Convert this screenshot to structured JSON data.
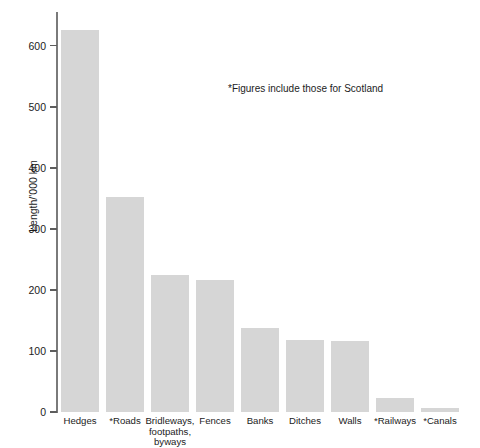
{
  "chart_data": {
    "type": "bar",
    "title": "Length of linear landscape features in Great Britain",
    "categories": [
      "Hedges",
      "*Roads",
      "Bridleways,\nfootpaths,\nbyways",
      "Fences",
      "Banks",
      "Ditches",
      "Walls",
      "*Railways",
      "*Canals"
    ],
    "values": [
      625,
      352,
      224,
      216,
      137,
      118,
      116,
      23,
      7
    ],
    "xlabel": "",
    "ylabel": "Length/'000 km",
    "ylim": [
      0,
      650
    ],
    "yticks": [
      0,
      100,
      200,
      300,
      400,
      500,
      600
    ],
    "ytick_labels": [
      "0",
      "100",
      "200",
      "300",
      "400",
      "500",
      "600"
    ],
    "grid": false,
    "legend": null,
    "annotations": [
      {
        "text": "*Figures include those for Scotland",
        "x": 228,
        "y": 83
      }
    ],
    "bar_color": "#d6d6d6",
    "axis_color": "#7a7a7a",
    "text_color": "#1c1c1c"
  }
}
